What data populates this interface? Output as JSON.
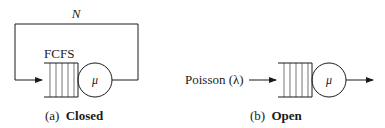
{
  "closed": {
    "population_label": "N",
    "discipline_label": "FCFS",
    "server_label": "μ",
    "caption_prefix": "(a)",
    "caption_title": "Closed"
  },
  "open": {
    "arrival_label": "Poisson (λ)",
    "server_label": "μ",
    "caption_prefix": "(b)",
    "caption_title": "Open"
  },
  "colors": {
    "stroke": "#1a1a1a",
    "background": "#ffffff"
  }
}
